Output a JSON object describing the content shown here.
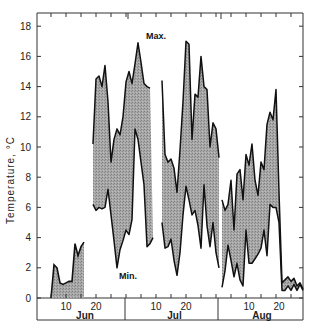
{
  "chart_data": {
    "type": "area",
    "title": "",
    "xlabel": "",
    "ylabel": "Temperature, °C",
    "ylim": [
      -1.5,
      19.0
    ],
    "yticks": [
      0,
      2,
      4,
      6,
      8,
      10,
      12,
      14,
      16,
      18
    ],
    "grid": false,
    "legend": "none",
    "annotations": [
      {
        "text": "Max.",
        "day": 36,
        "value": 16.9
      },
      {
        "text": "Min.",
        "day": 27,
        "value": 2.0
      }
    ],
    "months": [
      {
        "label": "Jun",
        "start_day": 1,
        "ticks": [
          {
            "label": "10",
            "day": 10
          },
          {
            "label": "20",
            "day": 20
          }
        ]
      },
      {
        "label": "Jul",
        "start_day": 31,
        "ticks": [
          {
            "label": "10",
            "day": 40
          },
          {
            "label": "20",
            "day": 50
          }
        ]
      },
      {
        "label": "Aug",
        "start_day": 62,
        "ticks": [
          {
            "label": "10",
            "day": 71
          },
          {
            "label": "20",
            "day": 81
          }
        ]
      }
    ],
    "x_unit": "day (Jun 1 = 1)",
    "series": [
      {
        "name": "Early June (Max/Min band from 0)",
        "segments": [
          {
            "days": [
              5,
              6,
              7,
              8,
              9,
              10,
              11,
              12,
              13,
              14,
              15,
              16
            ],
            "max": [
              0.0,
              2.2,
              2.0,
              1.0,
              0.9,
              1.0,
              1.1,
              1.1,
              3.6,
              2.8,
              3.4,
              3.7
            ],
            "min": [
              0.0,
              0.0,
              0.0,
              0.0,
              0.0,
              0.0,
              0.0,
              0.0,
              0.0,
              0.0,
              0.0,
              0.0
            ]
          }
        ]
      },
      {
        "name": "Max.",
        "segments": [
          {
            "days": [
              19,
              20,
              21,
              22,
              23,
              24,
              25,
              26,
              27,
              28,
              29,
              30,
              31,
              32,
              33,
              34,
              35,
              36,
              37,
              38,
              39
            ],
            "values": [
              10.2,
              14.5,
              14.7,
              14.0,
              15.4,
              13.0,
              9.0,
              10.5,
              11.2,
              10.8,
              12.0,
              14.3,
              15.0,
              14.2,
              15.5,
              16.9,
              15.6,
              14.2,
              14.0,
              13.9,
              null
            ]
          },
          {
            "days": [
              42,
              43,
              44,
              45,
              46,
              47,
              48,
              49,
              50,
              51,
              52,
              53,
              54,
              55,
              56,
              57,
              58,
              59,
              60,
              61
            ],
            "values": [
              14.4,
              9.5,
              9.0,
              9.2,
              8.6,
              7.0,
              9.8,
              13.0,
              17.0,
              16.8,
              10.5,
              13.5,
              13.3,
              16.0,
              14.0,
              13.8,
              10.0,
              11.6,
              11.2,
              9.3
            ]
          },
          {
            "days": [
              62,
              63,
              64,
              65,
              66,
              67,
              68,
              69,
              70,
              71,
              72,
              73,
              74,
              75,
              76,
              77,
              78,
              79,
              80,
              81,
              82,
              83,
              84,
              85,
              86,
              87,
              88,
              89
            ],
            "values": [
              6.5,
              5.8,
              6.2,
              7.8,
              4.5,
              8.2,
              8.5,
              6.5,
              9.5,
              8.8,
              10.2,
              7.8,
              6.8,
              9.0,
              8.5,
              11.5,
              12.3,
              11.8,
              13.8,
              7.0,
              1.0,
              1.2,
              1.4,
              1.1,
              1.3,
              0.8,
              1.0,
              0.6
            ]
          }
        ]
      },
      {
        "name": "Min.",
        "segments": [
          {
            "days": [
              19,
              20,
              21,
              22,
              23,
              24,
              25,
              26,
              27,
              28,
              29,
              30,
              31,
              32,
              33,
              34,
              35,
              36,
              37,
              38,
              39
            ],
            "values": [
              6.2,
              5.8,
              6.0,
              5.9,
              6.0,
              7.2,
              5.5,
              3.8,
              2.0,
              3.2,
              3.8,
              4.5,
              4.2,
              5.2,
              11.2,
              10.5,
              9.0,
              7.5,
              3.4,
              3.6,
              4.0
            ]
          },
          {
            "days": [
              42,
              43,
              44,
              45,
              46,
              47,
              48,
              49,
              50,
              51,
              52,
              53,
              54,
              55,
              56,
              57,
              58,
              59,
              60,
              61
            ],
            "values": [
              5.0,
              3.3,
              3.4,
              3.9,
              2.5,
              1.5,
              3.0,
              5.5,
              7.4,
              6.5,
              5.5,
              5.8,
              4.8,
              3.3,
              7.5,
              4.8,
              3.4,
              5.0,
              3.0,
              2.0
            ]
          },
          {
            "days": [
              62,
              63,
              64,
              65,
              66,
              67,
              68,
              69,
              70,
              71,
              72,
              73,
              74,
              75,
              76,
              77,
              78,
              79,
              80,
              81,
              82,
              83,
              84,
              85,
              86,
              87,
              88,
              89
            ],
            "values": [
              0.7,
              1.8,
              3.5,
              2.5,
              1.4,
              2.3,
              1.2,
              0.8,
              4.5,
              2.3,
              2.3,
              2.6,
              2.9,
              3.3,
              4.5,
              2.8,
              6.2,
              6.0,
              6.0,
              5.0,
              0.5,
              0.5,
              0.8,
              0.5,
              0.9,
              0.5,
              0.9,
              0.5
            ]
          }
        ]
      }
    ]
  },
  "axis": {
    "ylabel": "Temperature, °C",
    "yticks": [
      "0",
      "2",
      "4",
      "6",
      "8",
      "10",
      "12",
      "14",
      "16",
      "18"
    ],
    "months": [
      "Jun",
      "Jul",
      "Aug"
    ],
    "day_ticks": [
      "10",
      "20",
      "10",
      "20",
      "10",
      "20"
    ]
  },
  "annotations": {
    "max": "Max.",
    "min": "Min."
  },
  "colors": {
    "fill": "#9a9a9a",
    "line": "#111111",
    "axis": "#333333"
  }
}
